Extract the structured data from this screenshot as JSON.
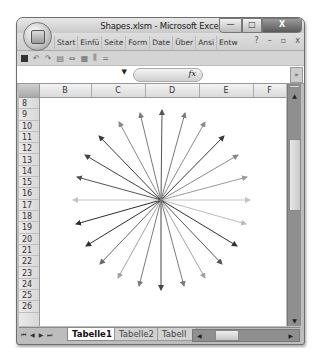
{
  "window": {
    "title": "Shapes.xlsm - Microsoft Excel",
    "controls": {
      "minimize": "—",
      "maximize": "□",
      "close": "X"
    }
  },
  "ribbon": {
    "tabs": [
      "Start",
      "Einfü",
      "Seite",
      "Form",
      "Date",
      "Über",
      "Ansi",
      "Entw"
    ],
    "right_controls": {
      "help": "?",
      "minimize": "–",
      "restore": "▫",
      "close": "x"
    }
  },
  "quick_access": {
    "items": [
      "save-icon",
      "undo-icon",
      "redo-icon",
      "print-preview-icon",
      "link-icon",
      "sheet-icon",
      "chart-icon",
      "customize-icon"
    ],
    "more": "="
  },
  "formula_bar": {
    "name_box_value": "",
    "fx_label": "fx",
    "formula_value": "",
    "expand": "»"
  },
  "grid": {
    "columns": [
      "B",
      "C",
      "D",
      "E",
      "F"
    ],
    "rows": [
      "8",
      "9",
      "10",
      "11",
      "12",
      "13",
      "14",
      "15",
      "16",
      "17",
      "18",
      "19",
      "20",
      "21",
      "22",
      "23",
      "24",
      "25",
      "26"
    ]
  },
  "drawing": {
    "type": "starburst-arrows",
    "center": [
      161,
      200
    ],
    "arrows": [
      {
        "end": [
          162,
          110
        ],
        "color": "#555555"
      },
      {
        "end": [
          185,
          113
        ],
        "color": "#7a7a7a"
      },
      {
        "end": [
          205,
          122
        ],
        "color": "#8c8c8c"
      },
      {
        "end": [
          224,
          136
        ],
        "color": "#3a3a3a"
      },
      {
        "end": [
          238,
          155
        ],
        "color": "#8a8a8a"
      },
      {
        "end": [
          247,
          177
        ],
        "color": "#9a9a9a"
      },
      {
        "end": [
          250,
          200
        ],
        "color": "#c4c4c4"
      },
      {
        "end": [
          246,
          224
        ],
        "color": "#bdbdbd"
      },
      {
        "end": [
          237,
          246
        ],
        "color": "#333333"
      },
      {
        "end": [
          222,
          264
        ],
        "color": "#555555"
      },
      {
        "end": [
          205,
          278
        ],
        "color": "#a3a3a3"
      },
      {
        "end": [
          184,
          286
        ],
        "color": "#7c7c7c"
      },
      {
        "end": [
          161,
          290
        ],
        "color": "#444444"
      },
      {
        "end": [
          139,
          286
        ],
        "color": "#7c7c7c"
      },
      {
        "end": [
          118,
          278
        ],
        "color": "#a3a3a3"
      },
      {
        "end": [
          100,
          264
        ],
        "color": "#6a6a6a"
      },
      {
        "end": [
          86,
          246
        ],
        "color": "#2e2e2e"
      },
      {
        "end": [
          76,
          224
        ],
        "color": "#2e2e2e"
      },
      {
        "end": [
          73,
          200
        ],
        "color": "#c4c4c4"
      },
      {
        "end": [
          77,
          177
        ],
        "color": "#555555"
      },
      {
        "end": [
          85,
          155
        ],
        "color": "#444444"
      },
      {
        "end": [
          99,
          136
        ],
        "color": "#3a3a3a"
      },
      {
        "end": [
          119,
          122
        ],
        "color": "#8a8a8a"
      },
      {
        "end": [
          140,
          113
        ],
        "color": "#7a7a7a"
      }
    ]
  },
  "sheet_tabs": {
    "nav": [
      "⏮",
      "◀",
      "▶",
      "⏭"
    ],
    "tabs": [
      {
        "label": "Tabelle1",
        "active": true
      },
      {
        "label": "Tabelle2",
        "active": false
      },
      {
        "label": "Tabell",
        "active": false
      }
    ]
  }
}
